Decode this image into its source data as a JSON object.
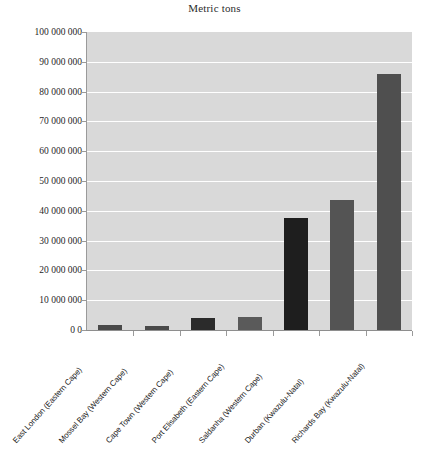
{
  "chart_data": {
    "type": "bar",
    "title": "Metric tons",
    "xlabel": "",
    "ylabel": "",
    "ylim": [
      0,
      100000000
    ],
    "grid": true,
    "legend": "none",
    "categories": [
      "East London (Eastern Cape)",
      "Mossel Bay (Western Cape)",
      "Cape Town (Western Cape)",
      "Port Elisabeth (Eastern Cape)",
      "Saldanha (Western Cape)",
      "Durban (Kwazulu-Natal)",
      "Richards Bay (Kwazulu-Natal)"
    ],
    "values": [
      1700000,
      1500000,
      4000000,
      4500000,
      37500000,
      43500000,
      86000000
    ],
    "bar_colors": [
      "#4a4a4a",
      "#4a4a4a",
      "#2b2b2b",
      "#5a5a5a",
      "#1e1e1e",
      "#545454",
      "#4f4f4f"
    ],
    "ytick_labels": [
      "100 000 000",
      "90 000 000",
      "80 000 000",
      "70 000 000",
      "60 000 000",
      "50 000 000",
      "40 000 000",
      "30 000 000",
      "20 000 000",
      "10 000 000",
      "0 0"
    ],
    "ytick_values": [
      100000000,
      90000000,
      80000000,
      70000000,
      60000000,
      50000000,
      40000000,
      30000000,
      20000000,
      10000000,
      0
    ],
    "plot_background": "#d9d9d9",
    "gridline_color": "#ffffff"
  }
}
